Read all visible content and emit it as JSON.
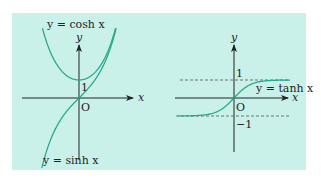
{
  "figure": {
    "background_color": "#c9f1ea",
    "curve_color": "#2aa88c",
    "axis_color": "#222222",
    "left_panel": {
      "curve_labels": {
        "cosh": "y = cosh x",
        "sinh": "y = sinh x"
      },
      "axis_labels": {
        "x": "x",
        "y": "y"
      },
      "origin_label": "O",
      "tick_label_one": "1"
    },
    "right_panel": {
      "curve_labels": {
        "tanh": "y = tanh x"
      },
      "axis_labels": {
        "x": "x",
        "y": "y"
      },
      "origin_label": "O",
      "tick_label_one": "1",
      "tick_label_minus_one": "−1"
    }
  },
  "chart_data": [
    {
      "type": "line",
      "title": "Hyperbolic cosine and sine",
      "series": [
        {
          "name": "y = cosh x",
          "function": "cosh",
          "x_range": [
            -2.1,
            2.1
          ],
          "min_point": [
            0,
            1
          ]
        },
        {
          "name": "y = sinh x",
          "function": "sinh",
          "x_range": [
            -2.1,
            2.1
          ],
          "passes_through": [
            0,
            0
          ]
        }
      ],
      "xlabel": "x",
      "ylabel": "y",
      "annotations": [
        "O",
        "1"
      ]
    },
    {
      "type": "line",
      "title": "Hyperbolic tangent",
      "series": [
        {
          "name": "y = tanh x",
          "function": "tanh",
          "x_range": [
            -3.3,
            3.3
          ],
          "asymptotes": [
            1,
            -1
          ]
        }
      ],
      "xlabel": "x",
      "ylabel": "y",
      "annotations": [
        "O",
        "1",
        "−1"
      ],
      "dashed_lines": [
        1,
        -1
      ]
    }
  ]
}
